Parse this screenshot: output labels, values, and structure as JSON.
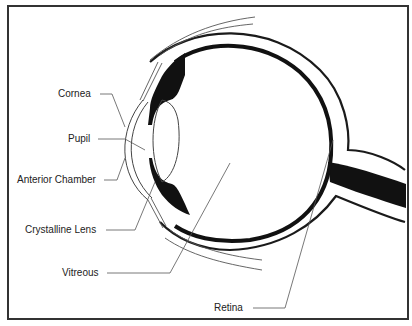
{
  "diagram": {
    "labels": [
      {
        "id": "cornea",
        "text": "Cornea"
      },
      {
        "id": "pupil",
        "text": "Pupil"
      },
      {
        "id": "anterior-chamber",
        "text": "Anterior Chamber"
      },
      {
        "id": "crystalline-lens",
        "text": "Crystalline Lens"
      },
      {
        "id": "vitreous",
        "text": "Vitreous"
      },
      {
        "id": "retina",
        "text": "Retina"
      }
    ]
  },
  "colors": {
    "stroke": "#1a1a1a",
    "fill_dark": "#111111",
    "thin_line": "#555555",
    "frame": "#333333",
    "background": "#ffffff"
  }
}
